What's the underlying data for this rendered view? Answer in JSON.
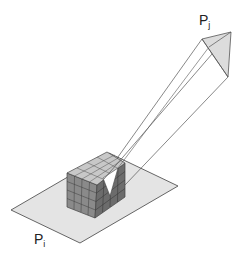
{
  "diagram": {
    "type": "radiosity form-factor hemicube projection",
    "labels": {
      "source_patch": {
        "base": "P",
        "sub": "i"
      },
      "target_patch": {
        "base": "P",
        "sub": "j"
      }
    },
    "elements": [
      {
        "name": "source-patch-plane",
        "description": "Light gray planar patch Pi"
      },
      {
        "name": "hemicube",
        "description": "Gridded cube (4x4 cells per face) resting on Pi"
      },
      {
        "name": "projection-beam",
        "description": "Lines from target patch corners converging on hemicube top"
      },
      {
        "name": "target-patch",
        "description": "Shaded polygon Pj at top right"
      },
      {
        "name": "projected-footprint",
        "description": "White triangle cut into hemicube where Pj projects"
      }
    ],
    "colors": {
      "plane_fill": "#e4e4e4",
      "outline": "#555555",
      "cube_top": "#c8c8c8",
      "cube_left": "#8a8a8a",
      "cube_right": "#6c6c6c",
      "target_fill": "#dcdcdc",
      "footprint": "#ffffff"
    }
  }
}
